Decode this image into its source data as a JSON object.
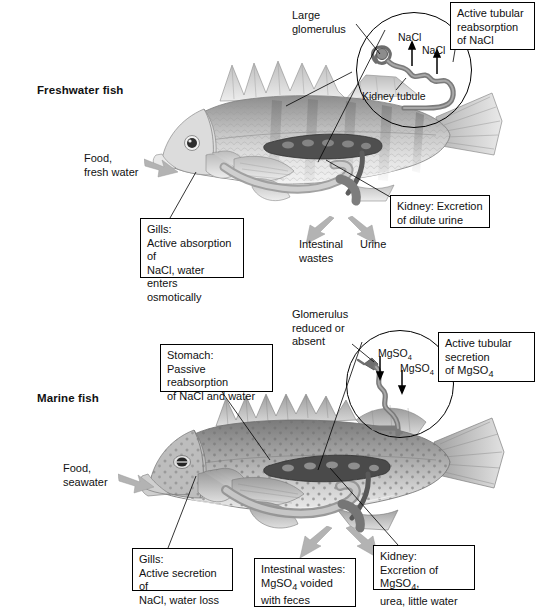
{
  "figure": {
    "sections": [
      {
        "id": "freshwater",
        "title": "Freshwater fish",
        "intake_label": "Food,\nfresh water",
        "inset": {
          "pointer_label": "Large\nglomerulus",
          "tubule_label": "Kidney tubule",
          "solute_1": "NaCl",
          "solute_2": "NaCl",
          "transport_box": "Active tubular\nreabsorption\nof NaCl",
          "arrow_direction": "out"
        },
        "callouts": [
          {
            "name": "gills",
            "text": "Gills:\nActive absorption of\nNaCl, water enters\nosmotically",
            "boxed": true
          },
          {
            "name": "kidney",
            "text": "Kidney: Excretion\nof dilute urine",
            "boxed": true
          },
          {
            "name": "intestinal-wastes",
            "text": "Intestinal\nwastes",
            "boxed": false
          },
          {
            "name": "urine",
            "text": "Urine",
            "boxed": false
          }
        ]
      },
      {
        "id": "marine",
        "title": "Marine fish",
        "intake_label": "Food,\nseawater",
        "inset": {
          "pointer_label": "Glomerulus\nreduced or\nabsent",
          "tubule_label": "",
          "solute_1": "MgSO",
          "solute_1_sub": "4",
          "solute_2": "MgSO",
          "solute_2_sub": "4",
          "transport_box_line1": "Active tubular",
          "transport_box_line2": "secretion",
          "transport_box_line3_prefix": "of MgSO",
          "transport_box_line3_sub": "4",
          "arrow_direction": "in"
        },
        "callouts": [
          {
            "name": "stomach",
            "text": "Stomach:\nPassive reabsorption\nof NaCl and water",
            "boxed": true
          },
          {
            "name": "gills",
            "text": "Gills:\nActive secretion of\nNaCl, water loss",
            "boxed": true
          },
          {
            "name": "intestinal-wastes",
            "line1": "Intestinal wastes:",
            "line2_prefix": "MgSO",
            "line2_sub": "4",
            "line2_suffix": " voided",
            "line3": "with feces",
            "boxed": true
          },
          {
            "name": "kidney",
            "line1": "Kidney:",
            "line2_prefix": "Excretion of MgSO",
            "line2_sub": "4",
            "line2_suffix": ",",
            "line3": "urea, little water",
            "boxed": true
          }
        ]
      }
    ],
    "colors": {
      "line": "#000000",
      "box_fill": "#ffffff",
      "flow_arrow": "#b3b3b3",
      "fish_body_light": "#d8d8d8",
      "fish_body_mid": "#a9a9a9",
      "fish_body_dark": "#6e6e6e",
      "organ_dark": "#4a4a4a"
    }
  }
}
